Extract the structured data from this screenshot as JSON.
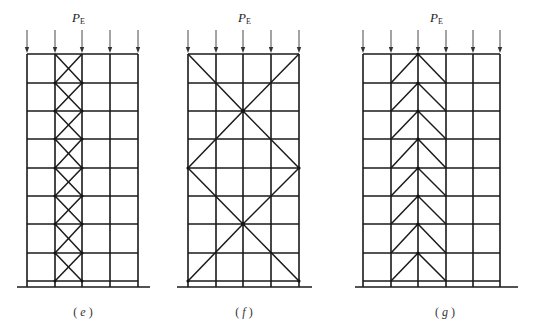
{
  "figure": {
    "load_label": {
      "main": "P",
      "subscript": "E"
    },
    "colors": {
      "line": "#1a1a1a",
      "background": "#ffffff"
    },
    "frames": [
      {
        "id": "e",
        "caption_open": "(",
        "caption_letter": "e",
        "caption_close": ")",
        "bracing": "X-bracing in one interior bay, every story",
        "columns_x": [
          27,
          55,
          82,
          110,
          138
        ],
        "floors_y": [
          54,
          83,
          111,
          139,
          168,
          196,
          224,
          253,
          281
        ],
        "ground": {
          "x1": 17,
          "x2": 150,
          "y": 287
        },
        "load_label_pos": {
          "x": 72,
          "y": 22
        },
        "caption_pos": {
          "x": 83,
          "y": 316
        }
      },
      {
        "id": "f",
        "caption_open": "(",
        "caption_letter": "f",
        "caption_close": ")",
        "bracing": "Large diamond/X bracing across full width spanning two stories",
        "columns_x": [
          188,
          216,
          243,
          271,
          299
        ],
        "floors_y": [
          54,
          83,
          111,
          139,
          168,
          196,
          224,
          253,
          281
        ],
        "ground": {
          "x1": 177,
          "x2": 312,
          "y": 287
        },
        "load_label_pos": {
          "x": 238,
          "y": 22
        },
        "caption_pos": {
          "x": 244,
          "y": 316
        }
      },
      {
        "id": "g",
        "caption_open": "(",
        "caption_letter": "g",
        "caption_close": ")",
        "bracing": "Inverted-V (chevron) bracing in two central bays, every story",
        "columns_x": [
          363,
          391,
          418,
          446,
          473,
          500
        ],
        "floors_y": [
          54,
          83,
          111,
          139,
          168,
          196,
          224,
          253,
          281
        ],
        "ground": {
          "x1": 355,
          "x2": 518,
          "y": 287
        },
        "load_label_pos": {
          "x": 430,
          "y": 22
        },
        "caption_pos": {
          "x": 445,
          "y": 316
        }
      }
    ]
  }
}
